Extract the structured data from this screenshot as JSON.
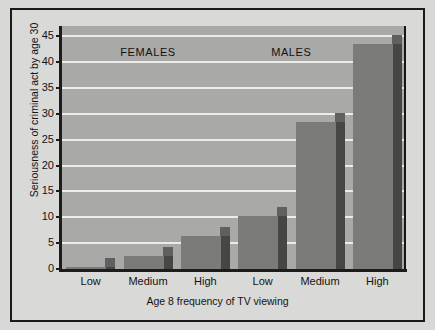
{
  "chart_data": {
    "type": "bar",
    "title": "",
    "xlabel": "Age 8 frequency of TV viewing",
    "ylabel": "Seriousness of criminal act by age 30",
    "categories": [
      "Low",
      "Medium",
      "High",
      "Low",
      "Medium",
      "High"
    ],
    "values": [
      0.3,
      2.5,
      6.4,
      10.3,
      28.5,
      43.5
    ],
    "group_labels": [
      "FEMALES",
      "MALES"
    ],
    "groups": [
      {
        "name": "FEMALES",
        "categories": [
          "Low",
          "Medium",
          "High"
        ],
        "values": [
          0.3,
          2.5,
          6.4
        ]
      },
      {
        "name": "MALES",
        "categories": [
          "Low",
          "Medium",
          "High"
        ],
        "values": [
          10.3,
          28.5,
          43.5
        ]
      }
    ],
    "ylim": [
      0,
      47
    ],
    "yticks": [
      0,
      5,
      10,
      15,
      20,
      25,
      30,
      35,
      40,
      45
    ],
    "ytick_labels": [
      "0",
      "5",
      "10",
      "15",
      "20",
      "25",
      "30",
      "35",
      "40",
      "45"
    ],
    "grid": true,
    "legend": "none",
    "style": "3d-bar",
    "colors": {
      "bar_face": "#7b7b79",
      "bar_side": "#464644",
      "plot_background": "#a9a9a7",
      "figure_background": "#d9d9d7",
      "gridline": "#ececea",
      "axis": "#1c1c1c",
      "text": "#131313",
      "frame": "#1a1a1a"
    }
  }
}
